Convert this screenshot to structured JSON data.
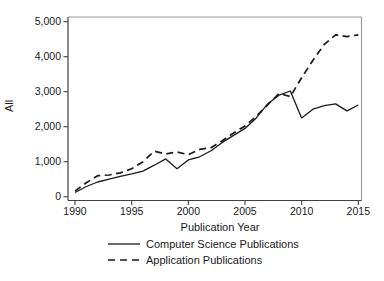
{
  "chart_data": {
    "type": "line",
    "xlabel": "Publication Year",
    "ylabel": "All",
    "xlim": [
      1990,
      2015
    ],
    "ylim": [
      0,
      5000
    ],
    "grid": false,
    "legend_position": "bottom-left",
    "xticks": [
      1990,
      1995,
      2000,
      2005,
      2010,
      2015
    ],
    "xtick_labels": [
      "1990",
      "1995",
      "2000",
      "2005",
      "2010",
      "2015"
    ],
    "yticks": [
      0,
      1000,
      2000,
      3000,
      4000,
      5000
    ],
    "ytick_labels": [
      "0",
      "1,000",
      "2,000",
      "3,000",
      "4,000",
      "5,000"
    ],
    "x": [
      1990,
      1991,
      1992,
      1993,
      1994,
      1995,
      1996,
      1997,
      1998,
      1999,
      2000,
      2001,
      2002,
      2003,
      2004,
      2005,
      2006,
      2007,
      2008,
      2009,
      2010,
      2011,
      2012,
      2013,
      2014,
      2015
    ],
    "series": [
      {
        "name": "Computer Science Publications",
        "style": "solid",
        "color": "#1a1a1a",
        "values": [
          120,
          290,
          420,
          500,
          580,
          650,
          730,
          900,
          1080,
          800,
          1050,
          1140,
          1310,
          1550,
          1750,
          1950,
          2250,
          2650,
          2900,
          3020,
          2250,
          2500,
          2600,
          2650,
          2450,
          2620
        ]
      },
      {
        "name": "Application Publications",
        "style": "dashed",
        "color": "#1a1a1a",
        "values": [
          160,
          400,
          600,
          620,
          680,
          800,
          1000,
          1300,
          1220,
          1280,
          1200,
          1350,
          1400,
          1600,
          1820,
          2020,
          2300,
          2620,
          2950,
          2860,
          3400,
          3900,
          4350,
          4625,
          4575,
          4625
        ]
      }
    ]
  },
  "colors": {
    "data_line": "#1a1a1a",
    "axis_line": "#404040",
    "plot_border": "#9a9a9a",
    "background": "#ffffff",
    "text": "#1a1a1a"
  }
}
